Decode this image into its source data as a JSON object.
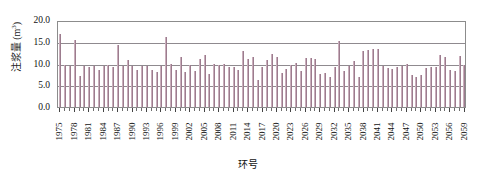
{
  "chart_data": {
    "type": "bar",
    "title": "",
    "xlabel": "环号",
    "ylabel": "注浆量 (m³)",
    "ylabel_text": "注浆量 (m",
    "ylabel_sup": "3",
    "ylabel_tail": ")",
    "ylim": [
      0,
      20
    ],
    "ytick_labels": [
      "20.0",
      "15.0",
      "10.0",
      "5.0",
      "0.0"
    ],
    "ytick_values": [
      20.0,
      15.0,
      10.0,
      5.0,
      0.0
    ],
    "grid": true,
    "legend": "none",
    "bar_color": "#9c7c8e",
    "bar_highlight_color": "#c9aebb",
    "axis_color": "#8c8c8c",
    "xtick_label_step": 3,
    "xtick_labels": [
      "1975",
      "1978",
      "1981",
      "1984",
      "1987",
      "1990",
      "1993",
      "1996",
      "1999",
      "2002",
      "2005",
      "2008",
      "2011",
      "2014",
      "2017",
      "2020",
      "2023",
      "2026",
      "2029",
      "2032",
      "2035",
      "2038",
      "2041",
      "2044",
      "2047",
      "2050",
      "2053",
      "2056",
      "2059"
    ],
    "categories": [
      "1975",
      "1976",
      "1977",
      "1978",
      "1979",
      "1980",
      "1981",
      "1982",
      "1983",
      "1984",
      "1985",
      "1986",
      "1987",
      "1988",
      "1989",
      "1990",
      "1991",
      "1992",
      "1993",
      "1994",
      "1995",
      "1996",
      "1997",
      "1998",
      "1999",
      "2000",
      "2001",
      "2002",
      "2003",
      "2004",
      "2005",
      "2006",
      "2007",
      "2008",
      "2009",
      "2010",
      "2011",
      "2012",
      "2013",
      "2014",
      "2015",
      "2016",
      "2017",
      "2018",
      "2019",
      "2020",
      "2021",
      "2022",
      "2023",
      "2024",
      "2025",
      "2026",
      "2027",
      "2028",
      "2029",
      "2030",
      "2031",
      "2032",
      "2033",
      "2034",
      "2035",
      "2036",
      "2037",
      "2038",
      "2039",
      "2040",
      "2041",
      "2042",
      "2043",
      "2044",
      "2045",
      "2046",
      "2047",
      "2048",
      "2049",
      "2050",
      "2051",
      "2052",
      "2053",
      "2054",
      "2055",
      "2056",
      "2057",
      "2058",
      "2059"
    ],
    "values": [
      16.8,
      9.6,
      9.5,
      15.3,
      7.2,
      9.4,
      9.3,
      9.5,
      8.6,
      9.4,
      9.6,
      9.3,
      14.2,
      9.4,
      10.9,
      9.4,
      8.4,
      9.5,
      9.4,
      8.6,
      8.0,
      9.5,
      16.2,
      9.8,
      8.4,
      11.4,
      8.0,
      9.6,
      8.3,
      11.0,
      12.0,
      7.5,
      9.8,
      9.6,
      9.9,
      9.3,
      9.2,
      8.4,
      12.9,
      11.0,
      11.6,
      6.2,
      9.3,
      10.7,
      12.3,
      11.6,
      7.8,
      8.8,
      9.6,
      10.1,
      8.2,
      11.3,
      11.2,
      11.0,
      7.6,
      7.9,
      7.0,
      9.2,
      15.2,
      8.3,
      9.5,
      10.6,
      6.8,
      12.8,
      13.2,
      13.3,
      13.3,
      9.4,
      9.0,
      8.7,
      9.2,
      9.4,
      9.8,
      7.4,
      7.0,
      7.3,
      9.0,
      9.1,
      9.3,
      11.9,
      11.5,
      8.6,
      8.2,
      11.8,
      9.7
    ]
  }
}
